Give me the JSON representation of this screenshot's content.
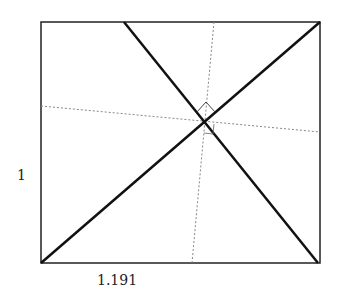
{
  "diagram": {
    "type": "geometry",
    "labels": {
      "height": "1",
      "width": "1.191"
    },
    "colors": {
      "stroke": "#111111",
      "dotted": "#888888",
      "background": "#ffffff"
    }
  }
}
